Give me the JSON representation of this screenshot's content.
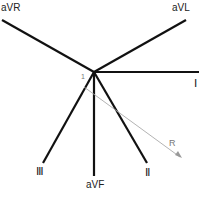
{
  "diagram": {
    "center": {
      "x": 94,
      "y": 72
    },
    "leads": [
      {
        "name": "aVR",
        "label": "aVR",
        "end": {
          "x": 2,
          "y": 20
        }
      },
      {
        "name": "aVL",
        "label": "aVL",
        "end": {
          "x": 186,
          "y": 20
        }
      },
      {
        "name": "I",
        "label": "Ⅰ",
        "end": {
          "x": 199,
          "y": 72
        }
      },
      {
        "name": "II",
        "label": "Ⅱ",
        "end": {
          "x": 147,
          "y": 163
        }
      },
      {
        "name": "aVF",
        "label": "aVF",
        "end": {
          "x": 94,
          "y": 176
        }
      },
      {
        "name": "III",
        "label": "Ⅲ",
        "end": {
          "x": 43,
          "y": 163
        }
      }
    ],
    "vector": {
      "label": "R",
      "start_label": "1",
      "color": "#999999"
    },
    "line_color": "#111111"
  }
}
